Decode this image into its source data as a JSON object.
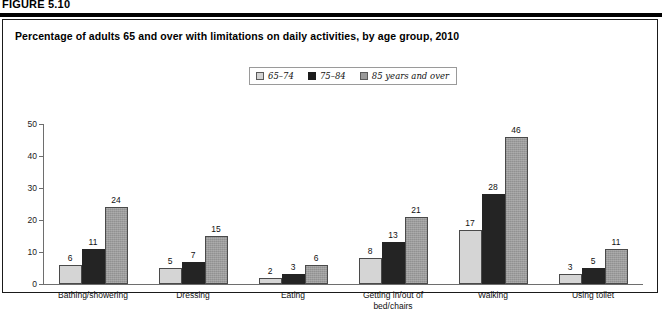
{
  "figure": {
    "label": "FIGURE 5.10",
    "title": "Percentage of adults 65 and over with limitations on daily activities, by age group, 2010"
  },
  "legend": {
    "items": [
      {
        "label": "65–74",
        "swatch": "light-gray-swatch",
        "color": "#d2d2d2"
      },
      {
        "label": "75–84",
        "swatch": "black-swatch",
        "color": "#1c1c1c"
      },
      {
        "label": "85 years and over",
        "swatch": "medium-gray-swatch",
        "color": "#9a9a9a"
      }
    ]
  },
  "yaxis": {
    "ticks": [
      "0",
      "10",
      "20",
      "30",
      "40",
      "50"
    ]
  },
  "chart_data": {
    "type": "bar",
    "title": "Percentage of adults 65 and over with limitations on daily activities, by age group, 2010",
    "xlabel": "",
    "ylabel": "",
    "ylim": [
      0,
      50
    ],
    "ytick_step": 10,
    "grid": false,
    "legend_position": "top-center",
    "categories": [
      "Bathing/showering",
      "Dressing",
      "Eating",
      "Getting in/out of\nbed/chairs",
      "Walking",
      "Using toilet"
    ],
    "categories_lines": [
      [
        "Bathing/showering"
      ],
      [
        "Dressing"
      ],
      [
        "Eating"
      ],
      [
        "Getting in/out of",
        "bed/chairs"
      ],
      [
        "Walking"
      ],
      [
        "Using toilet"
      ]
    ],
    "series": [
      {
        "name": "65–74",
        "color": "#d5d5d5",
        "values": [
          6,
          5,
          2,
          8,
          17,
          3
        ]
      },
      {
        "name": "75–84",
        "color": "#242424",
        "values": [
          11,
          7,
          3,
          13,
          28,
          5
        ]
      },
      {
        "name": "85 years and over",
        "color": "#9c9c9c",
        "values": [
          24,
          15,
          6,
          21,
          46,
          11
        ]
      }
    ]
  }
}
